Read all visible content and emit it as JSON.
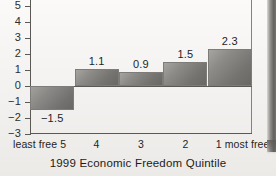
{
  "figure": {
    "background_color": "#f4f3f1",
    "axis_color": "#5a5956",
    "bar_fill_light": "#a7a5a2",
    "bar_fill_dark": "#6a6865",
    "text_color": "#1f1e1c",
    "scan_artifact": "right-edge-dark-gutter"
  },
  "chart_data": {
    "type": "bar",
    "title": "",
    "xlabel": "1999 Economic Freedom Quintile",
    "ylabel": "",
    "categories": [
      "5",
      "4",
      "3",
      "2",
      "1"
    ],
    "category_captions": [
      "least free 5",
      "4",
      "3",
      "2",
      "1 most free"
    ],
    "values": [
      -1.5,
      1.1,
      0.9,
      1.5,
      2.3
    ],
    "value_labels": [
      "−1.5",
      "1.1",
      "0.9",
      "1.5",
      "2.3"
    ],
    "ylim": [
      -3,
      5.4
    ],
    "yticks": [
      5,
      4,
      3,
      2,
      1,
      0,
      -1,
      -2,
      -3
    ],
    "ytick_labels": [
      "5",
      "4",
      "3",
      "2",
      "1",
      "0",
      "−1",
      "−2",
      "−3"
    ],
    "grid": false,
    "legend": null,
    "zero_line": true,
    "top_cropped": true
  },
  "axis": {
    "title": "1999 Economic Freedom Quintile",
    "left_end_label": "least free",
    "right_end_label": "most free"
  }
}
